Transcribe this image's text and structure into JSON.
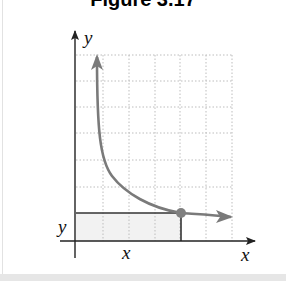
{
  "figure": {
    "title": "Figure 3.17"
  },
  "axes": {
    "y_axis_label": "y",
    "x_axis_label": "x",
    "y_level_label": "y",
    "x_level_label": "x"
  },
  "colors": {
    "axis": "#222222",
    "curve": "#7a7a7a",
    "point": "#808080",
    "grid": "#bdbdbd",
    "shaded_region": "#f2f2f2",
    "frame": "#e4e4e4"
  }
}
